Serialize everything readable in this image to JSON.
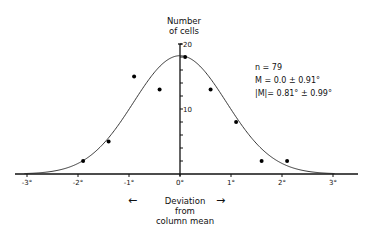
{
  "chart_data": {
    "type": "scatter",
    "title": "",
    "xlabel": "Deviation from column mean",
    "ylabel": "Number of cells",
    "x_ticks": [
      "-3°",
      "-2°",
      "-1°",
      "0°",
      "1°",
      "2°",
      "3°"
    ],
    "x_tick_values": [
      -3,
      -2,
      -1,
      0,
      1,
      2,
      3
    ],
    "y_ticks": [
      "20",
      "10"
    ],
    "y_tick_values": [
      20,
      10
    ],
    "y_minor_ticks": [
      2,
      4,
      6,
      8,
      10,
      12,
      14,
      16,
      18,
      20
    ],
    "xlim": [
      -3.4,
      3.6
    ],
    "ylim": [
      0,
      20
    ],
    "grid": false,
    "legend": null,
    "series": [
      {
        "name": "observed",
        "type": "scatter",
        "x": [
          -1.9,
          -1.4,
          -0.9,
          -0.4,
          0.1,
          0.6,
          1.1,
          1.6,
          2.1
        ],
        "y": [
          2,
          5,
          15,
          13,
          18,
          13,
          8,
          2,
          2
        ]
      },
      {
        "name": "gaussian fit",
        "type": "line",
        "mean": 0.0,
        "sd": 0.91,
        "peak": 18.2
      }
    ],
    "annotations": [
      "n = 79",
      "M = 0.0 ± 0.91°",
      "|M| = 0.81° ± 0.99°"
    ]
  },
  "labels": {
    "ylabel_line1": "Number",
    "ylabel_line2": "of cells",
    "stat_n": "n = 79",
    "stat_m": "M = 0.0 ± 0.91°",
    "stat_abs_m": "|M|= 0.81° ± 0.99°",
    "xlabel_line1": "Deviation",
    "xlabel_line2": "from",
    "xlabel_line3": "column mean",
    "arrow_left": "←",
    "arrow_right": "→"
  }
}
